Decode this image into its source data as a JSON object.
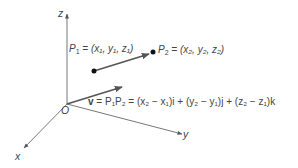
{
  "diagram": {
    "axes": {
      "z_label": "z",
      "y_label": "y",
      "x_label": "x",
      "origin_label": "O"
    },
    "points": {
      "p1": {
        "name": "P",
        "sub": "1",
        "coords": "= (x₁, y₁, z₁)"
      },
      "p2": {
        "name": "P",
        "sub": "2",
        "coords": "= (x₂, y₂, z₂)"
      }
    },
    "equation": {
      "vector": "v",
      "text": "= P₁P₂ = (x₂ − x₁)i + (y₂ − y₁)j + (z₂ − z₁)k"
    },
    "colors": {
      "line": "#555555",
      "axis": "#666666",
      "dot": "#111111"
    }
  }
}
